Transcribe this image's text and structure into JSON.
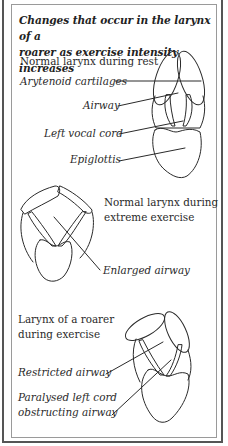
{
  "figure": {
    "title_line1": "Changes that occur in the larynx of a",
    "title_line2": "roarer as exercise intensity increases",
    "panels": [
      {
        "heading": "Normal larynx during rest",
        "labels": [
          "Arytenoid cartilages",
          "Airway",
          "Left vocal cord",
          "Epiglottis"
        ]
      },
      {
        "heading_line1": "Normal larynx during",
        "heading_line2": "extreme exercise",
        "labels": [
          "Enlarged airway"
        ]
      },
      {
        "heading_line1": "Larynx of a roarer",
        "heading_line2": "during exercise",
        "labels": [
          "Restricted airway",
          "Paralysed left cord",
          "obstructing airway"
        ]
      }
    ]
  },
  "colors": {
    "line": "#2a2a2a",
    "border_outer": "#555555",
    "border_inner": "#9a9a9a",
    "background": "#ffffff"
  }
}
